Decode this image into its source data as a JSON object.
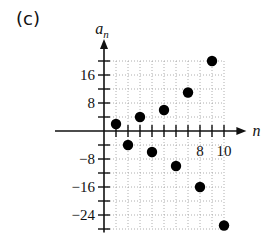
{
  "panel_label": "(c)",
  "chart_data": {
    "type": "scatter",
    "title": "",
    "xlabel": "n",
    "ylabel": "a_n",
    "x": [
      1,
      2,
      3,
      4,
      5,
      6,
      7,
      8,
      9,
      10
    ],
    "values": [
      2,
      -4,
      4,
      -6,
      6,
      -10,
      11,
      -16,
      20,
      -27
    ],
    "xlim": [
      0,
      11
    ],
    "ylim": [
      -28,
      22
    ],
    "x_tick_labels": [
      "8",
      "10"
    ],
    "x_tick_label_positions": [
      8,
      10
    ],
    "y_tick_labels": [
      "16",
      "8",
      "-8",
      "-16",
      "-24"
    ],
    "y_tick_label_positions": [
      16,
      8,
      -8,
      -16,
      -24
    ],
    "grid": true,
    "grid_style": "dotted",
    "marker_color": "#000000"
  }
}
